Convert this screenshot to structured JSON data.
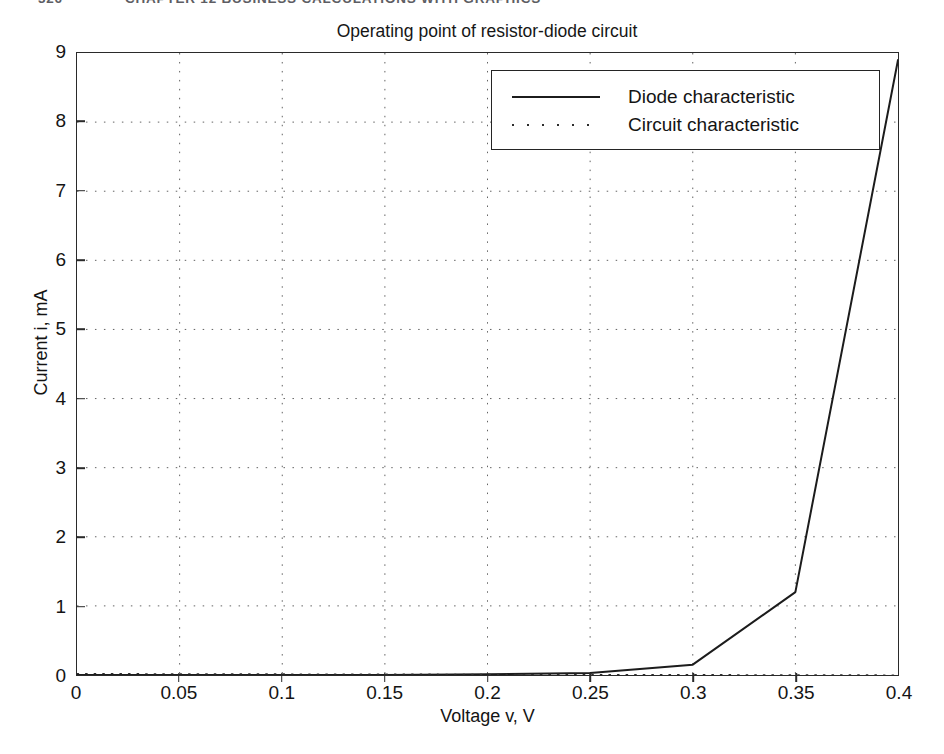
{
  "page_header": {
    "folio": "326",
    "running_head": "CHAPTER 12  BUSINESS CALCULATIONS WITH GRAPHICS"
  },
  "chart_data": {
    "type": "line",
    "title": "Operating point of resistor-diode circuit",
    "xlabel": "Voltage v, V",
    "ylabel": "Current i, mA",
    "xlim": [
      0,
      0.4
    ],
    "ylim": [
      0,
      9
    ],
    "grid": "dotted",
    "legend_position": "top-right-inside",
    "xticks": [
      "0",
      "0.05",
      "0.1",
      "0.15",
      "0.2",
      "0.25",
      "0.3",
      "0.35",
      "0.4"
    ],
    "xtick_values": [
      0,
      0.05,
      0.1,
      0.15,
      0.2,
      0.25,
      0.3,
      0.35,
      0.4
    ],
    "yticks": [
      "0",
      "1",
      "2",
      "3",
      "4",
      "5",
      "6",
      "7",
      "8",
      "9"
    ],
    "ytick_values": [
      0,
      1,
      2,
      3,
      4,
      5,
      6,
      7,
      8,
      9
    ],
    "series": [
      {
        "name": "Diode characteristic",
        "style": "solid",
        "color": "#1c1c1c",
        "x": [
          0,
          0.05,
          0.1,
          0.15,
          0.2,
          0.25,
          0.3,
          0.35,
          0.4
        ],
        "values": [
          0,
          0,
          0,
          0,
          0.01,
          0.03,
          0.15,
          1.2,
          8.9
        ]
      },
      {
        "name": "Circuit characteristic",
        "style": "dotted",
        "color": "#2e2e2e",
        "x": [
          0,
          0.4
        ],
        "values": [
          0.02,
          0.0
        ]
      }
    ]
  },
  "legend": {
    "entries": [
      {
        "label": "Diode characteristic",
        "style": "solid"
      },
      {
        "label": "Circuit characteristic",
        "style": "dotted"
      }
    ]
  }
}
